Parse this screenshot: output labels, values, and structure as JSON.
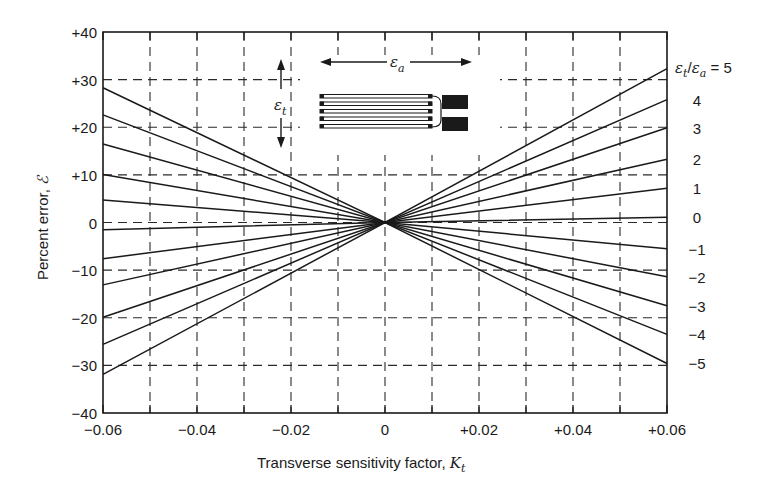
{
  "chart_data": {
    "type": "line",
    "title": "",
    "xlabel": "Transverse sensitivity factor, K_t",
    "xlabel_main": "Transverse sensitivity factor, ",
    "xlabel_symbol": "K",
    "xlabel_sub": "t",
    "ylabel": "Percent error, ℰ",
    "ylabel_main": "Percent error, ",
    "ylabel_symbol": "ℰ",
    "xlim": [
      -0.06,
      0.06
    ],
    "ylim": [
      -40,
      40
    ],
    "x_ticks_major": [
      -0.06,
      -0.04,
      -0.02,
      0,
      0.02,
      0.04,
      0.06
    ],
    "x_tick_labels": [
      "−0.06",
      "−0.04",
      "−0.02",
      "0",
      "+0.02",
      "+0.04",
      "+0.06"
    ],
    "x_grid": [
      -0.05,
      -0.03,
      -0.01,
      0.01,
      0.03,
      0.05
    ],
    "y_ticks": [
      40,
      30,
      20,
      10,
      0,
      -10,
      -20,
      -30,
      -40
    ],
    "y_tick_labels": [
      "+40",
      "+30",
      "+20",
      "+10",
      "0",
      "−10",
      "−20",
      "−30",
      "−40"
    ],
    "grid": "dashed",
    "legend_position": "right-edge labels",
    "series_param_label": "ε_t/ε_a",
    "series": [
      {
        "name": "5",
        "label": "= 5",
        "x": [
          -0.06,
          0,
          0.06
        ],
        "values": [
          28.3,
          0,
          32.3
        ]
      },
      {
        "name": "4",
        "label": "4",
        "x": [
          -0.06,
          0,
          0.06
        ],
        "values": [
          22.6,
          0,
          25.8
        ]
      },
      {
        "name": "3",
        "label": "3",
        "x": [
          -0.06,
          0,
          0.06
        ],
        "values": [
          16.5,
          0,
          19.9
        ]
      },
      {
        "name": "2",
        "label": "2",
        "x": [
          -0.06,
          0,
          0.06
        ],
        "values": [
          10.1,
          0,
          13.3
        ]
      },
      {
        "name": "1",
        "label": "1",
        "x": [
          -0.06,
          0,
          0.06
        ],
        "values": [
          4.7,
          0,
          7.2
        ]
      },
      {
        "name": "0",
        "label": "0",
        "x": [
          -0.06,
          0,
          0.06
        ],
        "values": [
          -1.5,
          0,
          1.1
        ]
      },
      {
        "name": "-1",
        "label": "−1",
        "x": [
          -0.06,
          0,
          0.06
        ],
        "values": [
          -7.6,
          0,
          -5.5
        ]
      },
      {
        "name": "-2",
        "label": "−2",
        "x": [
          -0.06,
          0,
          0.06
        ],
        "values": [
          -13.1,
          0,
          -11.4
        ]
      },
      {
        "name": "-3",
        "label": "−3",
        "x": [
          -0.06,
          0,
          0.06
        ],
        "values": [
          -19.9,
          0,
          -17.5
        ]
      },
      {
        "name": "-4",
        "label": "−4",
        "x": [
          -0.06,
          0,
          0.06
        ],
        "values": [
          -25.6,
          0,
          -23.5
        ]
      },
      {
        "name": "-5",
        "label": "−5",
        "x": [
          -0.06,
          0,
          0.06
        ],
        "values": [
          -31.9,
          0,
          -29.6
        ]
      }
    ],
    "annotations": {
      "axial_strain_label": "ε",
      "axial_strain_sub": "a",
      "transverse_strain_label": "ε",
      "transverse_strain_sub": "t",
      "gauge_diagram": "foil strain gauge grid with axial/transverse strain arrows"
    }
  },
  "colors": {
    "line": "#1a1a1a",
    "grid": "#2a2a2a",
    "background": "#ffffff"
  }
}
